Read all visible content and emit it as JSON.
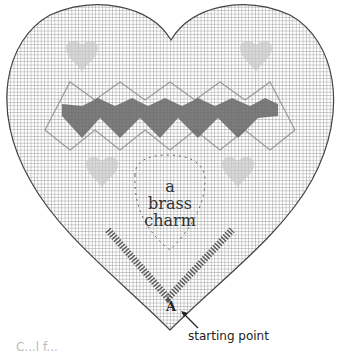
{
  "figure": {
    "center_label": [
      "a",
      "brass",
      "charm"
    ],
    "point_label": "A",
    "annotation": "starting point",
    "cutoff_text": "C...l f..."
  },
  "colors": {
    "grid": "#8a8a8a",
    "outline": "#444444",
    "stitch_dark": "#555555",
    "stitch_light": "#b0b0b0"
  }
}
